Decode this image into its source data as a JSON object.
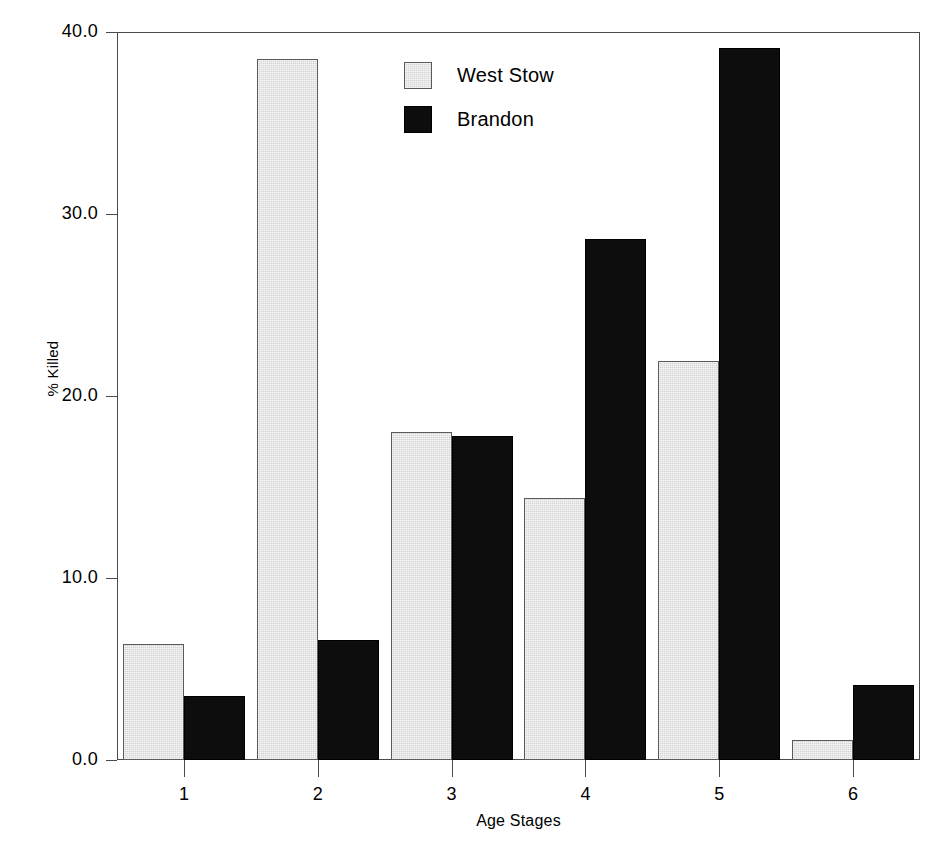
{
  "chart_data": {
    "type": "bar",
    "title": "",
    "xlabel": "Age Stages",
    "ylabel": "% Killed",
    "categories": [
      "1",
      "2",
      "3",
      "4",
      "5",
      "6"
    ],
    "series": [
      {
        "name": "West Stow",
        "color": "#d4d4d4",
        "values": [
          6.4,
          38.5,
          18.0,
          14.4,
          21.9,
          1.1
        ]
      },
      {
        "name": "Brandon",
        "color": "#0d0d0d",
        "values": [
          3.5,
          6.6,
          17.8,
          28.6,
          39.1,
          4.1
        ]
      }
    ],
    "ylim": [
      0.0,
      40.0
    ],
    "ytick_labels": [
      "0.0",
      "10.0",
      "20.0",
      "30.0",
      "40.0"
    ],
    "ytick_values": [
      0.0,
      10.0,
      20.0,
      30.0,
      40.0
    ],
    "grid": false,
    "legend_position": "top-center",
    "frame_color": "#4a4a4a",
    "background_color": "#ffffff"
  }
}
